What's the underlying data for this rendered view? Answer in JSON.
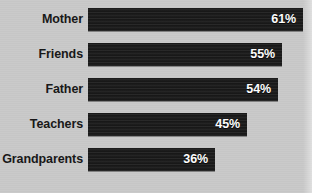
{
  "chart_data": {
    "type": "bar",
    "orientation": "horizontal",
    "title": "",
    "subtitle": "",
    "xlabel": "",
    "ylabel": "",
    "categories": [
      "Mother",
      "Friends",
      "Father",
      "Teachers",
      "Grandparents"
    ],
    "values": [
      61,
      55,
      54,
      45,
      36
    ],
    "value_labels": [
      "61%",
      "55%",
      "54%",
      "45%",
      "36%"
    ],
    "value_suffix": "%",
    "xlim": [
      0,
      61
    ],
    "grid": false,
    "legend": null,
    "axis_ticks_visible": false,
    "bars": [
      {
        "category": "Mother",
        "value": 61,
        "label": "61%"
      },
      {
        "category": "Friends",
        "value": 55,
        "label": "55%"
      },
      {
        "category": "Father",
        "value": 54,
        "label": "54%"
      },
      {
        "category": "Teachers",
        "value": 45,
        "label": "45%"
      },
      {
        "category": "Grandparents",
        "value": 36,
        "label": "36%"
      }
    ]
  },
  "style": {
    "background_color": "#c9c9c9",
    "bar_color": "#1b1b1b",
    "label_color": "#161616",
    "value_color": "#ffffff"
  }
}
